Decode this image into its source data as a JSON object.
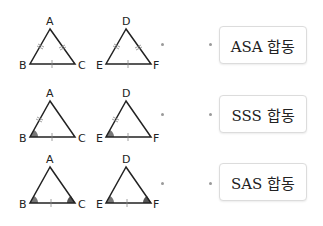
{
  "rows": [
    {
      "triangle1": {
        "vertices": [
          "A",
          "B",
          "C"
        ],
        "marks": "AB, AC double tick; BC single tick"
      },
      "triangle2": {
        "vertices": [
          "D",
          "E",
          "F"
        ],
        "marks": "DE, DF double tick; EF single tick"
      },
      "answer": "ASA 합동"
    },
    {
      "triangle1": {
        "vertices": [
          "A",
          "B",
          "C"
        ],
        "marks": "AB double tick; BC single tick; angle B shaded"
      },
      "triangle2": {
        "vertices": [
          "D",
          "E",
          "F"
        ],
        "marks": "DE double tick; EF single tick; angle E shaded"
      },
      "answer": "SSS 합동"
    },
    {
      "triangle1": {
        "vertices": [
          "A",
          "B",
          "C"
        ],
        "marks": "BC single tick; angles B, C shaded"
      },
      "triangle2": {
        "vertices": [
          "D",
          "E",
          "F"
        ],
        "marks": "EF single tick; angles E, F shaded"
      },
      "answer": "SAS 합동"
    }
  ],
  "colors": {
    "stroke": "#222222",
    "angle_fill": "#777777",
    "tick": "#888888",
    "dot": "#9a9a9a",
    "box_border": "#dcdcdc"
  }
}
